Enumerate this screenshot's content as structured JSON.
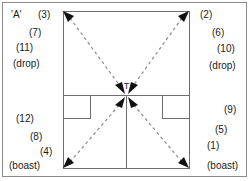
{
  "diagram": {
    "centre_label": "T",
    "court": {
      "type": "squash-court-plan",
      "features": [
        "front-wall-side",
        "short-line",
        "half-court-line",
        "left-service-box",
        "right-service-box"
      ]
    },
    "arrows": [
      {
        "name": "front-left-to-t",
        "from": "front-left-corner",
        "to": "t",
        "style": "dashed",
        "arrowhead_at": "both"
      },
      {
        "name": "front-right-to-t",
        "from": "front-right-corner",
        "to": "t",
        "style": "dashed",
        "arrowhead_at": "both"
      },
      {
        "name": "back-left-to-t",
        "from": "back-left-corner",
        "to": "t",
        "style": "dashed",
        "arrowhead_at": "both"
      },
      {
        "name": "back-right-to-t",
        "from": "back-right-corner",
        "to": "t",
        "style": "dashed",
        "arrowhead_at": "both"
      }
    ]
  },
  "labels": {
    "left_top": [
      {
        "name": "player-a",
        "text": "'A'"
      },
      {
        "name": "shot-3",
        "text": "(3)"
      },
      {
        "name": "shot-7",
        "text": "(7)"
      },
      {
        "name": "shot-11",
        "text": "(11)"
      },
      {
        "name": "drop-left-front",
        "text": "(drop)"
      }
    ],
    "right_top": [
      {
        "name": "shot-2",
        "text": "(2)"
      },
      {
        "name": "shot-6",
        "text": "(6)"
      },
      {
        "name": "shot-10",
        "text": "(10)"
      },
      {
        "name": "drop-right-front",
        "text": "(drop)"
      }
    ],
    "left_bottom": [
      {
        "name": "shot-12",
        "text": "(12)"
      },
      {
        "name": "shot-8",
        "text": "(8)"
      },
      {
        "name": "shot-4",
        "text": "(4)"
      },
      {
        "name": "boast-left-back",
        "text": "(boast)"
      }
    ],
    "right_bottom": [
      {
        "name": "shot-9",
        "text": "(9)"
      },
      {
        "name": "shot-5",
        "text": "(5)"
      },
      {
        "name": "shot-1",
        "text": "(1)"
      },
      {
        "name": "boast-right-back",
        "text": "(boast)"
      }
    ]
  },
  "colors": {
    "frame_border": "#8b8b8b",
    "court_line": "#6e6e6e",
    "dashed_arrow": "#8a8a8a",
    "arrowhead": "#111111",
    "text": "#1a1a1a",
    "background": "#ffffff"
  }
}
